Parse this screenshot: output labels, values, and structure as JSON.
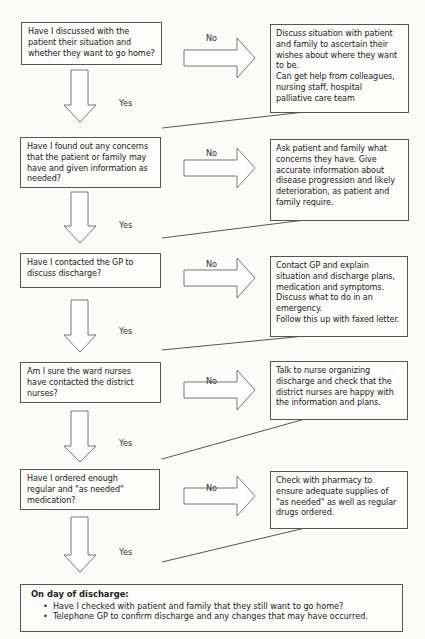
{
  "flowchart": {
    "steps": [
      {
        "question": "Have I discussed with the\npatient their situation and\nwhether they want to go home?",
        "no_label": "No",
        "yes_label": "Yes",
        "action": "Discuss situation with patient\nand family to ascertain their\nwishes  about where they want\nto be.\nCan get help from colleagues,\nnursing staff, hospital\npalliative care team"
      },
      {
        "question": "Have I found out any concerns\nthat the patient or family may\nhave and given information as\nneeded?",
        "no_label": "No",
        "yes_label": "Yes",
        "action": "Ask patient and family what\nconcerns they have. Give\naccurate information about\ndisease progression and likely\ndeterioration, as patient and\nfamily require."
      },
      {
        "question": "Have I contacted the GP to\ndiscuss discharge?",
        "no_label": "No",
        "yes_label": "Yes",
        "action": "Contact GP and explain\nsituation and discharge plans,\nmedication and symptoms.\nDiscuss what to do in an\nemergency.\nFollow this up with faxed letter."
      },
      {
        "question": "Am I sure the ward nurses\nhave contacted the district\nnurses?",
        "no_label": "No",
        "yes_label": "Yes",
        "action": "Talk to nurse organizing\ndischarge and check that the\ndistrict nurses are happy with\nthe information and plans."
      },
      {
        "question": "Have I ordered enough\nregular and \"as needed\"\nmedication?",
        "no_label": "No",
        "yes_label": "Yes",
        "action": "Check with pharmacy to\nensure adequate supplies of\n\"as needed\" as well as regular\ndrugs ordered."
      }
    ],
    "final": {
      "title": "On day of discharge:",
      "items": [
        "Have I checked with patient and family that they still want to go home?",
        "Telephone GP to confirm discharge and any changes that may have occurred."
      ]
    }
  },
  "colors": {
    "border": "#555555",
    "background": "#fbfbf9",
    "text": "#222222"
  }
}
